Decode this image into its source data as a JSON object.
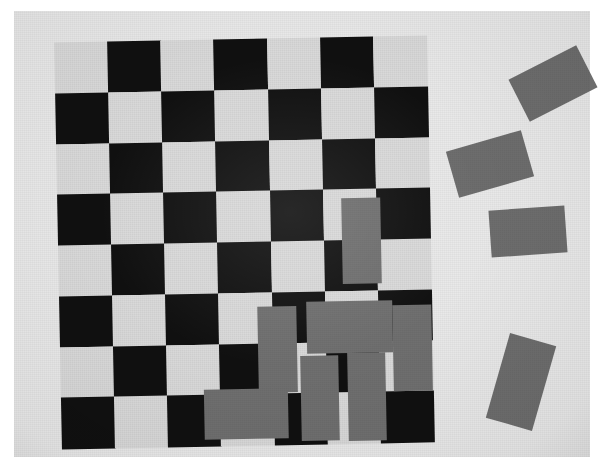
{
  "scene": {
    "title": "Checkerboard calibration pattern with gray rectangular blocks",
    "width": 604,
    "height": 467,
    "background_color": "#ffffff",
    "surface_color": "#e9e9e9"
  },
  "board": {
    "label": "checkerboard",
    "columns": 7,
    "rows": 8,
    "light_color": "#d9d9d9",
    "dark_color": "#101010",
    "rotation_deg": -1.1,
    "left": 44,
    "top": 28,
    "width": 372,
    "height": 406,
    "cell_width": 53,
    "cell_height": 50.75,
    "pattern": [
      [
        0,
        1,
        0,
        1,
        0,
        1,
        0
      ],
      [
        1,
        0,
        1,
        0,
        1,
        0,
        1
      ],
      [
        0,
        1,
        0,
        1,
        0,
        1,
        0
      ],
      [
        1,
        0,
        1,
        0,
        1,
        0,
        1
      ],
      [
        0,
        1,
        0,
        1,
        0,
        1,
        0
      ],
      [
        1,
        0,
        1,
        0,
        1,
        0,
        1
      ],
      [
        0,
        1,
        0,
        1,
        0,
        1,
        0
      ],
      [
        1,
        0,
        1,
        0,
        1,
        0,
        1
      ]
    ]
  },
  "blocks_on_board": {
    "label": "gray blocks on board",
    "color": "#6f6f6f",
    "items": [
      {
        "name": "block-1",
        "left": 284,
        "top": 161,
        "width": 39,
        "height": 86,
        "rotation_deg": 0
      },
      {
        "name": "block-2",
        "left": 198,
        "top": 268,
        "width": 39,
        "height": 86,
        "rotation_deg": 0
      },
      {
        "name": "block-3",
        "left": 247,
        "top": 264,
        "width": 86,
        "height": 52,
        "rotation_deg": 0
      },
      {
        "name": "block-4",
        "left": 333,
        "top": 269,
        "width": 39,
        "height": 86,
        "rotation_deg": 0
      },
      {
        "name": "block-5",
        "left": 240,
        "top": 318,
        "width": 38,
        "height": 85,
        "rotation_deg": 0
      },
      {
        "name": "block-6",
        "left": 287,
        "top": 316,
        "width": 38,
        "height": 88,
        "rotation_deg": 0
      },
      {
        "name": "block-7",
        "left": 143,
        "top": 350,
        "width": 84,
        "height": 50,
        "rotation_deg": 0
      }
    ]
  },
  "loose_blocks": {
    "label": "gray blocks beside board",
    "color": "#6d6d6d",
    "items": [
      {
        "name": "loose-1",
        "left": 515,
        "top": 60,
        "width": 76,
        "height": 47,
        "rotation_deg": -27
      },
      {
        "name": "loose-2",
        "left": 451,
        "top": 140,
        "width": 78,
        "height": 48,
        "rotation_deg": -16
      },
      {
        "name": "loose-3",
        "left": 490,
        "top": 208,
        "width": 76,
        "height": 47,
        "rotation_deg": -4
      },
      {
        "name": "loose-4",
        "left": 497,
        "top": 338,
        "width": 48,
        "height": 88,
        "rotation_deg": 16
      }
    ]
  }
}
